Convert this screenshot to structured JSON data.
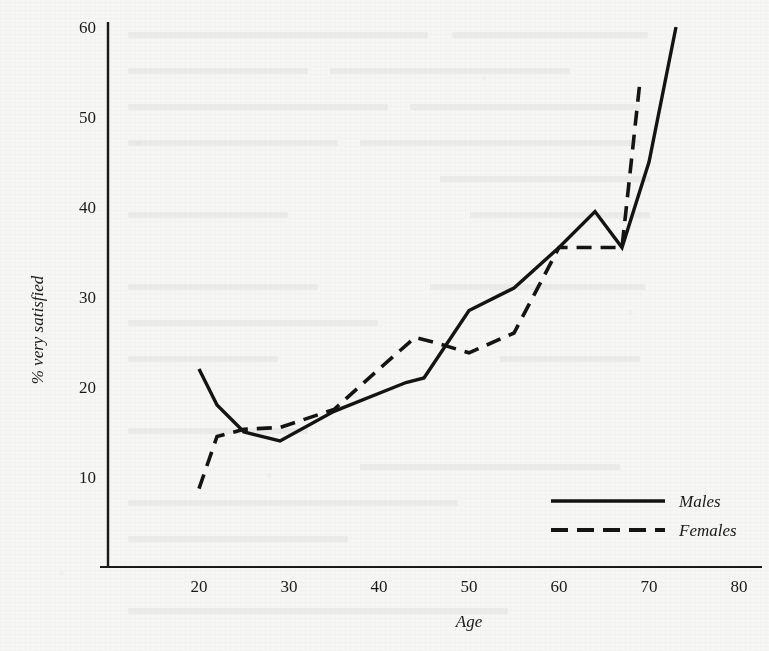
{
  "figure": {
    "background_color": "#f6f6f4",
    "ink_color": "#141412"
  },
  "chart_data": {
    "type": "line",
    "title": "",
    "xlabel": "Age",
    "ylabel": "% very satisfied",
    "xlim": [
      15,
      85
    ],
    "ylim": [
      5,
      61
    ],
    "xticks": [
      20,
      30,
      40,
      50,
      60,
      70,
      80
    ],
    "xtick_labels": [
      "20",
      "30",
      "40",
      "50",
      "60",
      "70",
      "80"
    ],
    "yticks": [
      10,
      20,
      30,
      40,
      50,
      60
    ],
    "ytick_labels": [
      "10",
      "20",
      "30",
      "40",
      "50",
      "60"
    ],
    "grid": false,
    "legend_position": "lower right",
    "series": [
      {
        "name": "Males",
        "style": "solid",
        "x": [
          20,
          22,
          25,
          29,
          35,
          43,
          45,
          50,
          55,
          60,
          64,
          67,
          70,
          73
        ],
        "values": [
          22.0,
          18.0,
          15.0,
          14.0,
          17.3,
          20.5,
          21.0,
          28.5,
          31.0,
          35.5,
          39.5,
          35.5,
          45.0,
          60.0
        ]
      },
      {
        "name": "Females",
        "style": "dashed",
        "x": [
          20,
          22,
          25,
          29,
          35,
          40,
          44,
          46,
          50,
          55,
          60,
          64,
          67,
          69
        ],
        "values": [
          8.7,
          14.5,
          15.3,
          15.5,
          17.5,
          22.0,
          25.5,
          25.0,
          23.8,
          26.0,
          35.5,
          35.5,
          35.5,
          54.0
        ]
      }
    ],
    "legend_entries": [
      {
        "label": "Males",
        "style": "solid"
      },
      {
        "label": "Females",
        "style": "dashed"
      }
    ]
  }
}
